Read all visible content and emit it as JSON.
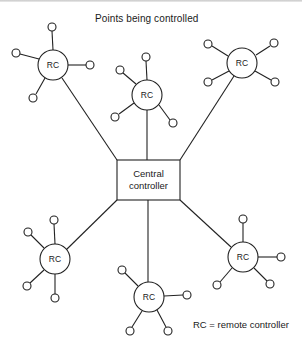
{
  "diagram": {
    "title": "Points being controlled",
    "legend": "RC = remote controller",
    "central": {
      "line1": "Central",
      "line2": "controller"
    },
    "rc_label": "RC",
    "colors": {
      "stroke": "#222222",
      "background": "#ffffff",
      "text": "#1a1a1a"
    },
    "remote_controllers": [
      {
        "id": "rc-top-left",
        "label": "RC"
      },
      {
        "id": "rc-top-middle",
        "label": "RC"
      },
      {
        "id": "rc-top-right",
        "label": "RC"
      },
      {
        "id": "rc-bottom-left",
        "label": "RC"
      },
      {
        "id": "rc-bottom-middle",
        "label": "RC"
      },
      {
        "id": "rc-bottom-right",
        "label": "RC"
      }
    ]
  }
}
